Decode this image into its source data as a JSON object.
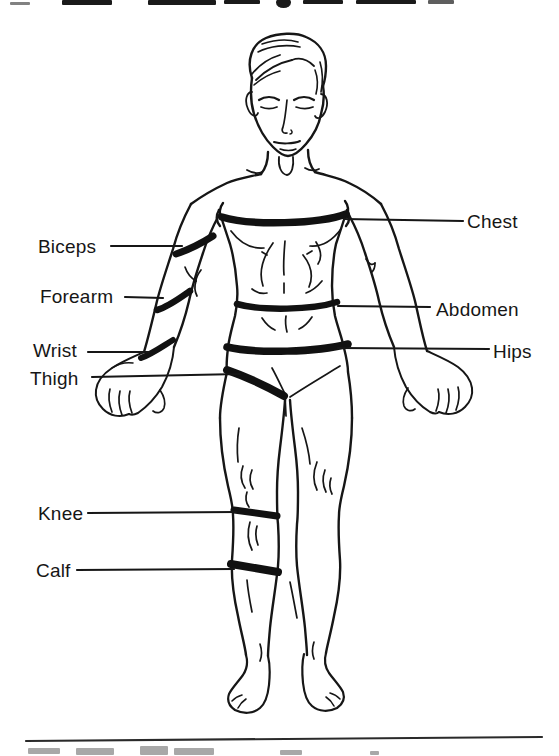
{
  "colors": {
    "ink": "#161616",
    "paper": "#ffffff"
  },
  "diagram": {
    "labels": {
      "chest": "Chest",
      "abdomen": "Abdomen",
      "hips": "Hips",
      "biceps": "Biceps",
      "forearm": "Forearm",
      "wrist": "Wrist",
      "thigh": "Thigh",
      "knee": "Knee",
      "calf": "Calf"
    }
  }
}
